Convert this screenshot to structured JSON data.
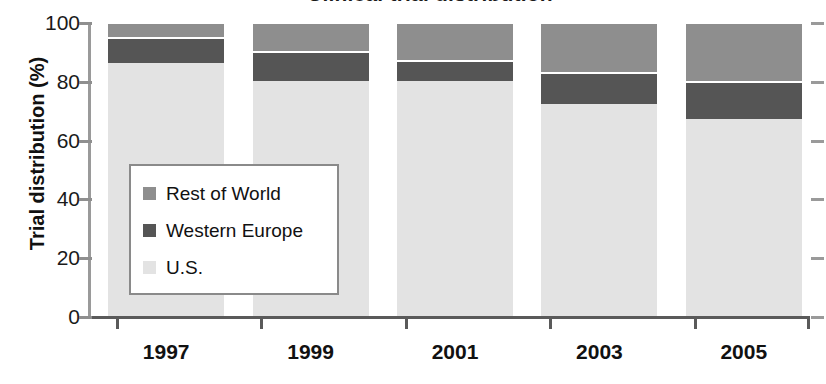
{
  "chart_data": {
    "type": "bar",
    "title": "Clinical trial distribution",
    "subtitle": "",
    "xlabel": "",
    "ylabel": "Trial distribution (%)",
    "categories": [
      "1997",
      "1999",
      "2001",
      "2003",
      "2005"
    ],
    "ylim": [
      0,
      100
    ],
    "yticks": [
      0,
      20,
      40,
      60,
      80,
      100
    ],
    "ytick_labels": [
      "0",
      "20",
      "40",
      "60",
      "80",
      "100"
    ],
    "grid": false,
    "stacked": true,
    "stack_order_bottom_to_top": [
      "U.S.",
      "Western Europe",
      "Rest of World"
    ],
    "legend_position": "inside-lower-left",
    "series": [
      {
        "name": "U.S.",
        "color": "#e3e3e3",
        "values": [
          86,
          80,
          80,
          72,
          67
        ]
      },
      {
        "name": "Western Europe",
        "color": "#555555",
        "values": [
          9,
          10,
          7,
          11,
          13
        ]
      },
      {
        "name": "Rest of World",
        "color": "#8e8e8e",
        "values": [
          5,
          10,
          13,
          17,
          20
        ]
      }
    ],
    "cumulative_tops": {
      "U.S.": [
        86,
        80,
        80,
        72,
        67
      ],
      "Western Europe": [
        95,
        90,
        87,
        83,
        80
      ],
      "Rest of World": [
        100,
        100,
        100,
        100,
        100
      ]
    }
  },
  "legend": {
    "items": [
      {
        "label": "Rest of World",
        "color": "#8e8e8e"
      },
      {
        "label": "Western Europe",
        "color": "#555555"
      },
      {
        "label": "U.S.",
        "color": "#e3e3e3"
      }
    ]
  },
  "axes": {
    "y_title": "Trial distribution (%)",
    "y_labels": [
      "100",
      "80",
      "60",
      "40",
      "20",
      "0"
    ],
    "x_labels": [
      "1997",
      "1999",
      "2001",
      "2003",
      "2005"
    ]
  }
}
